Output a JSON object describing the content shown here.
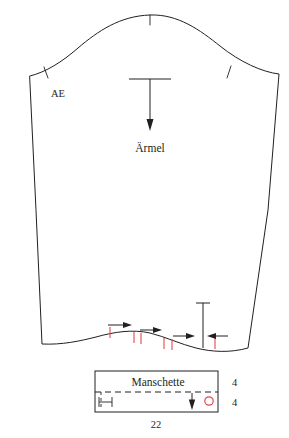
{
  "document": {
    "type": "sewing-pattern-diagram",
    "language": "de",
    "background_color": "#ffffff",
    "line_color": "#231f20",
    "accent_color": "#e8454a"
  },
  "sleeve": {
    "name": "sleeve-piece",
    "label": "Ärmel",
    "ease_label": "AE",
    "notches": [
      {
        "name": "cap-apex-notch",
        "position": "top-center"
      },
      {
        "name": "front-cap-notch",
        "position": "left-cap"
      },
      {
        "name": "back-cap-notch",
        "position": "right-cap"
      }
    ],
    "grainline": {
      "name": "grainline-arrow",
      "direction": "down"
    },
    "gathering": {
      "tick_color": "#e8454a",
      "arrow_color": "#231f20",
      "note": "ease/gather marks along hem"
    }
  },
  "cuff": {
    "name": "cuff-piece",
    "label": "Manschette",
    "width_label": "22",
    "height_upper_label": "4",
    "height_lower_label": "4",
    "fold_line": "dashed",
    "buttonhole_marker": "o",
    "grain_arrow": "down"
  }
}
